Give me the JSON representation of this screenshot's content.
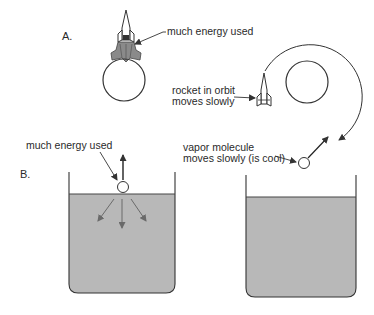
{
  "panel_a": {
    "label": "A.",
    "launch_label": "much energy used",
    "orbit_label_line1": "rocket in orbit",
    "orbit_label_line2": "moves slowly"
  },
  "panel_b": {
    "label": "B.",
    "evap_label": "much energy used",
    "vapor_label_line1": "vapor molecule",
    "vapor_label_line2": "moves slowly (is cool)"
  },
  "colors": {
    "stroke": "#333333",
    "liquid": "#b8b8b8",
    "liquid_arrow": "#6a6a6a",
    "background": "#ffffff"
  }
}
